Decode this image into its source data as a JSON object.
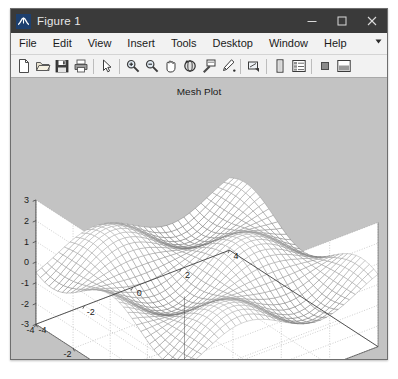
{
  "window": {
    "title": "Figure 1",
    "app_icon": "matlab-membrane-icon",
    "controls": {
      "minimize": "minimize-icon",
      "maximize": "maximize-icon",
      "close": "close-icon"
    }
  },
  "menubar": {
    "items": [
      {
        "label": "File"
      },
      {
        "label": "Edit"
      },
      {
        "label": "View"
      },
      {
        "label": "Insert"
      },
      {
        "label": "Tools"
      },
      {
        "label": "Desktop"
      },
      {
        "label": "Window"
      },
      {
        "label": "Help"
      }
    ],
    "overflow": "chevron-down-icon"
  },
  "toolbar": {
    "buttons": [
      {
        "name": "new-figure-icon",
        "tooltip": "New Figure"
      },
      {
        "name": "open-file-icon",
        "tooltip": "Open File"
      },
      {
        "name": "save-figure-icon",
        "tooltip": "Save Figure"
      },
      {
        "name": "print-figure-icon",
        "tooltip": "Print Figure"
      },
      {
        "name": "edit-plot-arrow-icon",
        "tooltip": "Edit Plot"
      },
      {
        "name": "zoom-in-icon",
        "tooltip": "Zoom In"
      },
      {
        "name": "zoom-out-icon",
        "tooltip": "Zoom Out"
      },
      {
        "name": "pan-hand-icon",
        "tooltip": "Pan"
      },
      {
        "name": "rotate-3d-icon",
        "tooltip": "Rotate 3D"
      },
      {
        "name": "data-cursor-icon",
        "tooltip": "Data Cursor"
      },
      {
        "name": "brush-data-icon",
        "tooltip": "Brush/Select Data"
      },
      {
        "name": "link-plot-icon",
        "tooltip": "Link Plot"
      },
      {
        "name": "insert-colorbar-icon",
        "tooltip": "Insert Colorbar"
      },
      {
        "name": "insert-legend-icon",
        "tooltip": "Insert Legend"
      },
      {
        "name": "hide-plot-tools-icon",
        "tooltip": "Hide Plot Tools"
      },
      {
        "name": "show-plot-tools-icon",
        "tooltip": "Show Plot Tools and Dock Figure"
      }
    ]
  },
  "colors": {
    "titlebar": "#3a3a3a",
    "figure_background": "#c3c3c3",
    "axes_background": "#ffffff",
    "mesh_dark": "#1f1f1f",
    "mesh_light": "#f2f2f2",
    "grid": "#9a9a9a",
    "axis_line": "#404040"
  },
  "chart_data": {
    "type": "mesh",
    "title": "Mesh Plot",
    "xlabel": "",
    "ylabel": "",
    "zlabel": "",
    "xlim": [
      -4,
      4
    ],
    "ylim": [
      -4,
      4
    ],
    "zlim": [
      -3,
      3
    ],
    "xticks": [
      -4,
      -2,
      0,
      2,
      4
    ],
    "yticks": [
      -4,
      -2,
      0,
      2,
      4
    ],
    "zticks": [
      -3,
      -2,
      -1,
      0,
      1,
      2,
      3
    ],
    "xticklabels": [
      "-4",
      "-2",
      "0",
      "2",
      "4"
    ],
    "yticklabels": [
      "-4",
      "-2",
      "0",
      "2",
      "4"
    ],
    "zticklabels": [
      "-3",
      "-2",
      "-1",
      "0",
      "1",
      "2",
      "3"
    ],
    "grid": true,
    "legend": "none",
    "colormap": "gray",
    "function": "z = sin(x) * cos(y)",
    "grid_steps": 34,
    "view_azimuth": -37.5,
    "view_elevation": 30
  }
}
